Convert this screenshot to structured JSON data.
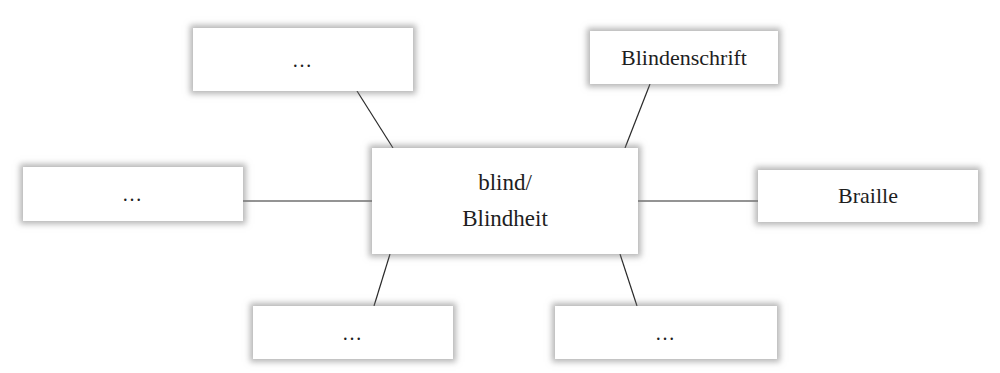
{
  "diagram": {
    "type": "mind-map",
    "center": {
      "line1": "blind/",
      "line2": "Blindheit"
    },
    "nodes": [
      {
        "id": "top-left",
        "label": "…"
      },
      {
        "id": "top-right",
        "label": "Blindenschrift"
      },
      {
        "id": "left",
        "label": "…"
      },
      {
        "id": "right",
        "label": "Braille"
      },
      {
        "id": "bottom-left",
        "label": "…"
      },
      {
        "id": "bottom-right",
        "label": "…"
      }
    ],
    "edges": [
      {
        "from": "center",
        "to": "top-left"
      },
      {
        "from": "center",
        "to": "top-right"
      },
      {
        "from": "center",
        "to": "left"
      },
      {
        "from": "center",
        "to": "right"
      },
      {
        "from": "center",
        "to": "bottom-left"
      },
      {
        "from": "center",
        "to": "bottom-right"
      }
    ],
    "colors": {
      "line": "#2a2a2a",
      "box": "#ffffff",
      "shadow": "#8a8a8a",
      "text": "#1e1e1e"
    }
  }
}
